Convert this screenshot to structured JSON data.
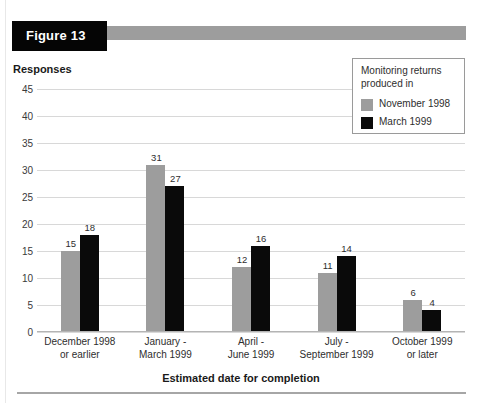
{
  "header": {
    "figure_label": "Figure 13",
    "tag_color": "#050505",
    "bar_color": "#9d9d9d"
  },
  "legend": {
    "title": "Monitoring returns produced in",
    "entries": [
      {
        "label": "November 1998",
        "color": "#9d9d9d"
      },
      {
        "label": "March 1999",
        "color": "#0a0a0a"
      }
    ]
  },
  "chart_data": {
    "type": "bar",
    "title": "Figure 13",
    "xlabel": "Estimated date for completion",
    "ylabel": "Responses",
    "ylim": [
      0,
      45
    ],
    "yticks": [
      0,
      5,
      10,
      15,
      20,
      25,
      30,
      35,
      40,
      45
    ],
    "ytick_labels": [
      "0",
      "5",
      "10",
      "15",
      "20",
      "25",
      "30",
      "35",
      "40",
      "45"
    ],
    "grid": true,
    "legend_position": "top-right",
    "categories": [
      "December 1998\nor earlier",
      "January -\nMarch 1999",
      "April -\nJune 1999",
      "July -\nSeptember 1999",
      "October 1999\nor later"
    ],
    "category_lines": [
      [
        "December 1998",
        "or earlier"
      ],
      [
        "January -",
        "March 1999"
      ],
      [
        "April -",
        "June 1999"
      ],
      [
        "July -",
        "September 1999"
      ],
      [
        "October 1999",
        "or later"
      ]
    ],
    "series": [
      {
        "name": "November 1998",
        "color": "#9d9d9d",
        "values": [
          15,
          31,
          12,
          11,
          6
        ]
      },
      {
        "name": "March 1999",
        "color": "#0a0a0a",
        "values": [
          18,
          27,
          16,
          14,
          4
        ]
      }
    ]
  }
}
